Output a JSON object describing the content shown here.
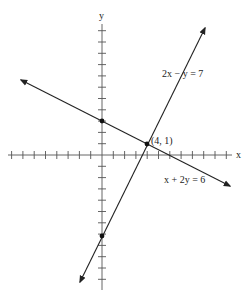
{
  "diagram": {
    "type": "coordinate-graph",
    "axes": {
      "x_label": "x",
      "y_label": "y",
      "origin_px": [
        102,
        155
      ],
      "unit_px": 11.3,
      "x_ticks": [
        -8,
        -7,
        -6,
        -5,
        -4,
        -3,
        -2,
        -1,
        1,
        2,
        3,
        4,
        5,
        6,
        7,
        8,
        9,
        10,
        11
      ],
      "y_ticks": [
        11,
        10,
        9,
        8,
        7,
        6,
        5,
        4,
        3,
        2,
        1,
        -1,
        -2,
        -3,
        -4,
        -5,
        -6,
        -7,
        -8,
        -9,
        -10,
        -11
      ]
    },
    "lines": [
      {
        "equation": "2x − y = 7",
        "label_pos": [
          162,
          77
        ]
      },
      {
        "equation": "x + 2y = 6",
        "label_pos": [
          164,
          183
        ]
      }
    ],
    "points": [
      {
        "coords": [
          4,
          1
        ],
        "label": "(4, 1)"
      },
      {
        "coords": [
          0,
          3
        ],
        "label": ""
      },
      {
        "coords": [
          0,
          -7
        ],
        "label": ""
      }
    ],
    "colors": {
      "ink": "#222222",
      "background": "#ffffff"
    }
  }
}
